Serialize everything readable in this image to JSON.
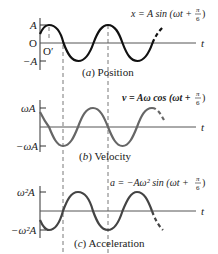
{
  "diagram": {
    "type": "shm-graphs",
    "phase": "π/6",
    "panels": [
      {
        "id": "position",
        "caption": "(a) Position",
        "caption_letter": "a",
        "caption_text": "Position",
        "equation": "x = A sin (ωt + π/6)",
        "eq_lhs": "x = A sin (ωt + ",
        "eq_num": "π",
        "eq_den": "6",
        "eq_close": ")",
        "y_max_label": "A",
        "y_zero_label": "O",
        "y_min_label": "−A",
        "origin_shift_label": "O′",
        "t_label": "t",
        "color": "#111111"
      },
      {
        "id": "velocity",
        "caption": "(b) Velocity",
        "caption_letter": "b",
        "caption_text": "Velocity",
        "equation": "v = Aω cos (ωt + π/6)",
        "eq_lhs": "v = Aω cos (ωt + ",
        "eq_num": "π",
        "eq_den": "6",
        "eq_close": ")",
        "y_max_label": "ωA",
        "y_min_label": "−ωA",
        "t_label": "t",
        "color": "#666666"
      },
      {
        "id": "acceleration",
        "caption": "(c) Acceleration",
        "caption_letter": "c",
        "caption_text": "Acceleration",
        "equation": "a = −Aω² sin (ωt + π/6)",
        "eq_lhs": "a = −Aω² sin (ωt + ",
        "eq_num": "π",
        "eq_den": "6",
        "eq_close": ")",
        "y_max_label": "ω²A",
        "y_min_label": "−ω²A",
        "t_label": "t",
        "color": "#444444"
      }
    ]
  }
}
